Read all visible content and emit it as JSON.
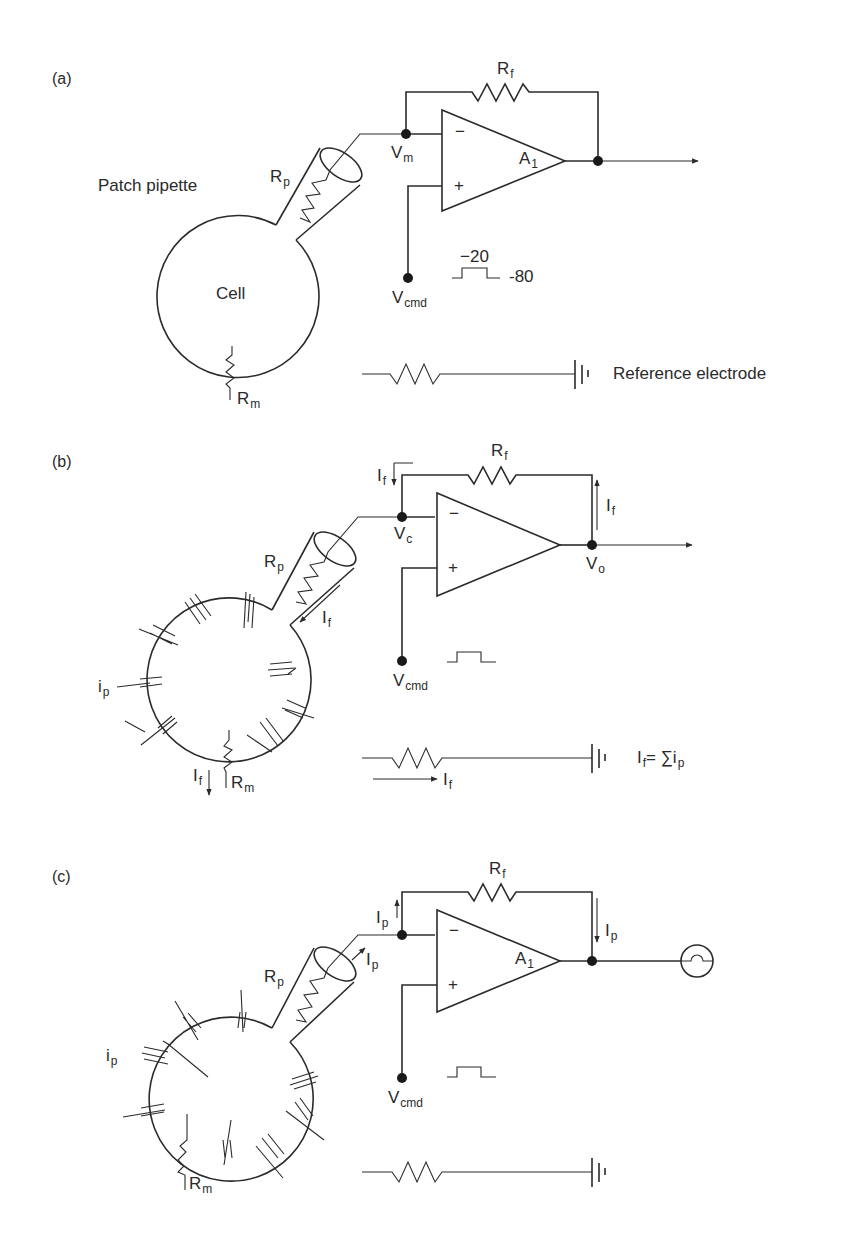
{
  "panels": {
    "a": {
      "tag": "(a)",
      "patch_pipette": "Patch pipette",
      "cell": "Cell",
      "rp": {
        "main": "R",
        "sub": "p"
      },
      "rf": {
        "main": "R",
        "sub": "f"
      },
      "rm": {
        "main": "R",
        "sub": "m"
      },
      "vm": {
        "main": "V",
        "sub": "m"
      },
      "vcmd": {
        "main": "V",
        "sub": "cmd"
      },
      "amp": {
        "main": "A",
        "sub": "1"
      },
      "minus": "−",
      "plus": "+",
      "step_high": "−20",
      "step_low": "-80",
      "reference_electrode": "Reference electrode"
    },
    "b": {
      "tag": "(b)",
      "rp": {
        "main": "R",
        "sub": "p"
      },
      "rf": {
        "main": "R",
        "sub": "f"
      },
      "rm": {
        "main": "R",
        "sub": "m"
      },
      "vc": {
        "main": "V",
        "sub": "c"
      },
      "vo": {
        "main": "V",
        "sub": "o"
      },
      "vcmd": {
        "main": "V",
        "sub": "cmd"
      },
      "ip": {
        "main": "i",
        "sub": "p"
      },
      "if": {
        "main": "I",
        "sub": "f"
      },
      "minus": "−",
      "plus": "+",
      "equation": "I",
      "equation_sub": "f",
      "equation_rest": "= ∑i",
      "equation_rest_sub": "p"
    },
    "c": {
      "tag": "(c)",
      "rp": {
        "main": "R",
        "sub": "p"
      },
      "rf": {
        "main": "R",
        "sub": "f"
      },
      "rm": {
        "main": "R",
        "sub": "m"
      },
      "vcmd": {
        "main": "V",
        "sub": "cmd"
      },
      "ip": {
        "main": "i",
        "sub": "p"
      },
      "Ip": {
        "main": "I",
        "sub": "p"
      },
      "amp": {
        "main": "A",
        "sub": "1"
      },
      "minus": "−",
      "plus": "+"
    }
  }
}
